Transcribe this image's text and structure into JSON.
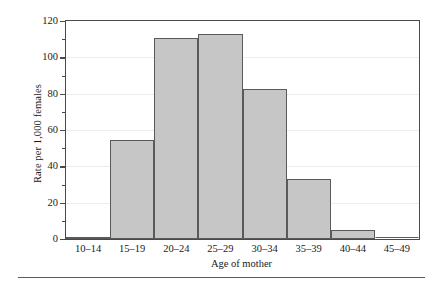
{
  "chart_data": {
    "type": "bar",
    "title": "",
    "xlabel": "Age of mother",
    "ylabel": "Rate per 1,000 females",
    "categories": [
      "10–14",
      "15–19",
      "20–24",
      "25–29",
      "30–34",
      "35–39",
      "40–44",
      "45–49"
    ],
    "values": [
      1.1,
      54.5,
      110.6,
      113.0,
      82.5,
      33.0,
      5.0,
      0.0
    ],
    "ylim": [
      0,
      120
    ],
    "y_ticks_major": [
      0,
      20,
      40,
      60,
      80,
      100,
      120
    ],
    "y_ticks_major_labels": [
      "0",
      "20",
      "40",
      "60",
      "80",
      "100",
      "120"
    ],
    "y_ticks_minor": [
      10,
      30,
      50,
      70,
      90,
      110
    ],
    "grid": true,
    "legend": "none",
    "bar_fill_color": "#c6c6c6",
    "bar_edge_color": "#5a5a5a",
    "axis_color": "#4a4a4a",
    "grid_color": "#ededed"
  }
}
